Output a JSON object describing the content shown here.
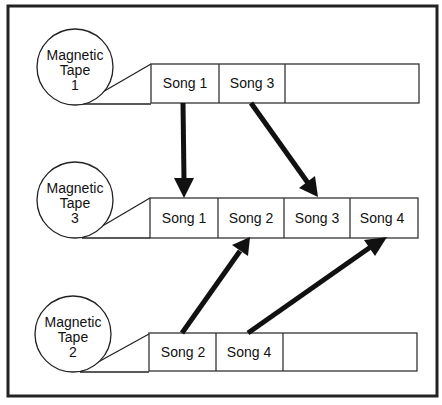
{
  "diagram": {
    "tapes": [
      {
        "id": "tape1",
        "label_lines": [
          "Magnetic",
          "Tape",
          "1"
        ],
        "segments": [
          "Song 1",
          "Song 3",
          ""
        ]
      },
      {
        "id": "tape3",
        "label_lines": [
          "Magnetic",
          "Tape",
          "3"
        ],
        "segments": [
          "Song 1",
          "Song 2",
          "Song 3",
          "Song 4"
        ]
      },
      {
        "id": "tape2",
        "label_lines": [
          "Magnetic",
          "Tape",
          "2"
        ],
        "segments": [
          "Song 2",
          "Song 4",
          ""
        ]
      }
    ],
    "arrows": [
      {
        "from": "Tape 1 / Song 1",
        "to": "Tape 3 / Song 1"
      },
      {
        "from": "Tape 1 / Song 3",
        "to": "Tape 3 / Song 3"
      },
      {
        "from": "Tape 2 / Song 2",
        "to": "Tape 3 / Song 2"
      },
      {
        "from": "Tape 2 / Song 4",
        "to": "Tape 3 / Song 4"
      }
    ],
    "colors": {
      "stroke": "#222222",
      "background": "#ffffff"
    }
  }
}
